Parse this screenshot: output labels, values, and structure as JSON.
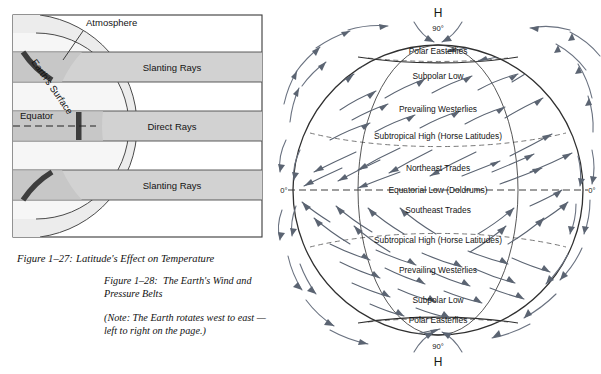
{
  "figure_27": {
    "title_prefix": "Figure 1–27:",
    "title_text": "Latitude's Effect on Temperature",
    "labels": {
      "atmosphere": "Atmosphere",
      "earth_surface": "Earth's Surface",
      "equator": "Equator",
      "slanting_rays_top": "Slanting Rays",
      "direct_rays": "Direct Rays",
      "slanting_rays_bottom": "Slanting Rays"
    },
    "colors": {
      "band_fill": "#d2d2d2",
      "atmosphere_fill": "#ececec",
      "surface_dark": "#4a4a4a",
      "border": "#3a3a3a"
    }
  },
  "figure_28": {
    "title_prefix": "Figure 1–28:",
    "title_line1": "The Earth's Wind and",
    "title_line2": "Pressure Belts",
    "note_line1": "(Note:   The Earth rotates west to east —",
    "note_line2": "left to right on the page.)",
    "pole_north": {
      "pressure_symbol": "H",
      "latitude": "90°"
    },
    "pole_south": {
      "pressure_symbol": "H",
      "latitude": "90°"
    },
    "equator_left_label": "0°",
    "equator_right_label": "0°",
    "belts_north": [
      "Polar Easterlies",
      "Subpolar Low",
      "Prevailing Westerlies",
      "Subtropical High  (Horse Latitudes)",
      "Northeast Trades"
    ],
    "equator_label": "Equatorial Low  (Doldrums)",
    "belts_south": [
      "Southeast Trades",
      "Subtropical High  (Horse Latitudes)",
      "Prevailing Westerlies",
      "Subpolar Low",
      "Polar Easterlies"
    ],
    "colors": {
      "globe_outline": "#2f2f2f",
      "arrow": "#5b6472",
      "dashed": "#6b6b6b"
    }
  }
}
